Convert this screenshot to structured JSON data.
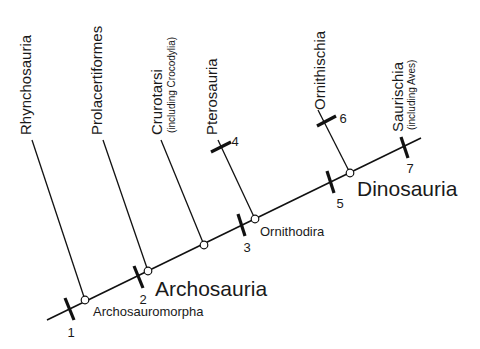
{
  "diagram": {
    "type": "cladogram",
    "taxa": [
      {
        "name": "Rhynchosauria",
        "note": ""
      },
      {
        "name": "Prolacertiformes",
        "note": ""
      },
      {
        "name": "Crurotarsi",
        "note": "(including Crocodylia)"
      },
      {
        "name": "Pterosauria",
        "note": ""
      },
      {
        "name": "Ornithischia",
        "note": ""
      },
      {
        "name": "Saurischia",
        "note": "(including Aves)"
      }
    ],
    "nodes": [
      {
        "name": "Archosauromorpha"
      },
      {
        "name": "Archosauria"
      },
      {
        "name": "Ornithodira"
      },
      {
        "name": "Dinosauria"
      }
    ],
    "characters": [
      "1",
      "2",
      "3",
      "4",
      "5",
      "6",
      "7"
    ],
    "colors": {
      "line": "#111111",
      "background": "#ffffff",
      "text": "#1a1a1a"
    }
  }
}
